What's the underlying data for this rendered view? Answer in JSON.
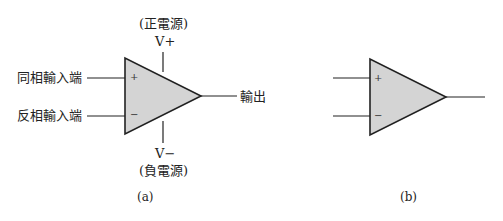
{
  "figure_a": {
    "noninverting_input": "同相輸入端",
    "inverting_input": "反相輸入端",
    "output": "輸出",
    "positive_supply_label": "(正電源)",
    "positive_supply_symbol": "V+",
    "negative_supply_symbol": "V−",
    "negative_supply_label": "(負電源)",
    "plus_sign": "+",
    "minus_sign": "−",
    "caption": "(a)"
  },
  "figure_b": {
    "plus_sign": "+",
    "minus_sign": "−",
    "caption": "(b)"
  },
  "colors": {
    "triangle_fill": "#d4d4d4",
    "stroke": "#222222"
  }
}
